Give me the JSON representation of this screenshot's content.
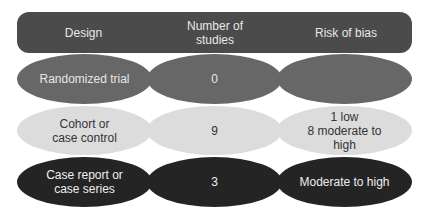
{
  "header": {
    "columns": [
      "Design",
      "Number of studies",
      "Risk of bias"
    ],
    "design": "Design",
    "number_line1": "Number of",
    "number_line2": "studies",
    "risk": "Risk of bias"
  },
  "rows": [
    {
      "design": "Randomized trial",
      "number": "0",
      "risk": "",
      "color": "#676767"
    },
    {
      "design_line1": "Cohort or",
      "design_line2": "case control",
      "number": "9",
      "risk_line1": "1 low",
      "risk_line2": "8 moderate to",
      "risk_line3": "high",
      "color": "#dcdcdc"
    },
    {
      "design_line1": "Case report or",
      "design_line2": "case series",
      "number": "3",
      "risk": "Moderate to high",
      "color": "#242424"
    }
  ],
  "colors": {
    "header": "#4b4b4b",
    "row1": "#676767",
    "row2": "#dcdcdc",
    "row3": "#242424"
  }
}
